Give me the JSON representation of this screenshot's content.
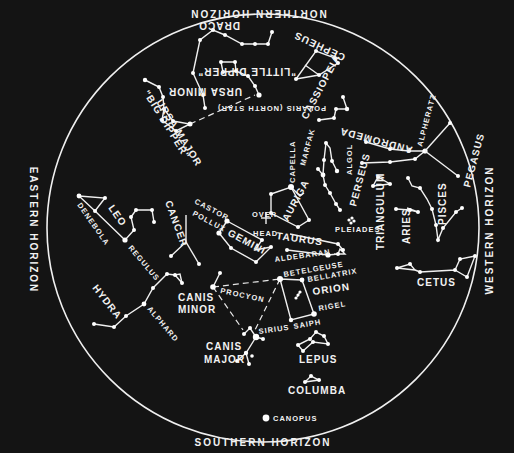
{
  "colors": {
    "background": "#141414",
    "ink": "#f2f2f2",
    "page": "#ffffff"
  },
  "horizon_circle": {
    "cx": 263,
    "cy": 228,
    "rx": 216,
    "ry": 214
  },
  "horizons": {
    "north": "NORTHERN HORIZON",
    "south": "SOUTHERN HORIZON",
    "east": "EASTERN HORIZON",
    "west": "WESTERN HORIZON"
  },
  "overhead": {
    "label_top": "OVER",
    "label_bottom": "HEAD"
  },
  "constellations": {
    "ursa_major": {
      "name": "URSA MAJOR",
      "nickname": "\"BIG DIPPER\""
    },
    "ursa_minor": {
      "name": "URSA MINOR",
      "nickname": "\"LITTLE DIPPER\""
    },
    "draco": {
      "name": "DRACO"
    },
    "cepheus": {
      "name": "CEPHEUS"
    },
    "cassiopeia": {
      "name": "CASSIOPEIA"
    },
    "andromeda": {
      "name": "ANDROMEDA"
    },
    "pegasus": {
      "name": "PEGASUS"
    },
    "perseus": {
      "name": "PERSEUS"
    },
    "auriga": {
      "name": "AURIGA"
    },
    "triangulum": {
      "name": "TRIANGULUM"
    },
    "aries": {
      "name": "ARIES"
    },
    "pisces": {
      "name": "PISCES"
    },
    "cetus": {
      "name": "CETUS"
    },
    "taurus": {
      "name": "TAURUS"
    },
    "gemini": {
      "name": "GEMINI"
    },
    "cancer": {
      "name": "CANCER"
    },
    "leo": {
      "name": "LEO"
    },
    "hydra": {
      "name": "HYDRA"
    },
    "canis_minor": {
      "name": "CANIS MINOR"
    },
    "canis_major": {
      "name": "CANIS MAJOR"
    },
    "orion": {
      "name": "ORION"
    },
    "lepus": {
      "name": "LEPUS"
    },
    "columba": {
      "name": "COLUMBA"
    }
  },
  "stars": {
    "polaris": "POLARIS (NORTH STAR)",
    "alpheratz": "ALPHERATZ",
    "marfak": "MARFAK",
    "algol": "ALGOL",
    "capella": "CAPELLA",
    "pleiades": "PLEIADES",
    "aldebaran": "ALDEBARAN",
    "betelgeuse": "BETELGEUSE",
    "bellatrix": "BELLATRIX",
    "rigel": "RIGEL",
    "saiph": "SAIPH",
    "sirius": "SIRIUS",
    "procyon": "PROCYON",
    "castor": "CASTOR",
    "pollux": "POLLUX",
    "regulus": "REGULUS",
    "denebola": "DENEBOLA",
    "alphard": "ALPHARD",
    "canopus": "CANOPUS"
  }
}
